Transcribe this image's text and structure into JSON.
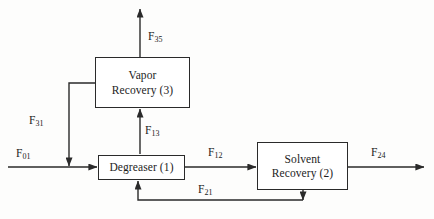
{
  "diagram": {
    "type": "process-flow-diagram",
    "colors": {
      "line": "#2a2a2a",
      "box_border": "#2a2a2a",
      "box_fill": "#ffffff",
      "text": "#1b1b1b",
      "background": "#fdfdfc"
    },
    "units": [
      {
        "id": "degreaser",
        "label": "Degreaser (1)",
        "number": "1",
        "name": "Degreaser",
        "x": 98,
        "y": 155,
        "w": 87,
        "h": 25
      },
      {
        "id": "solvent-recovery",
        "label": "Solvent\nRecovery (2)",
        "number": "2",
        "name": "Solvent Recovery",
        "x": 257,
        "y": 142,
        "w": 91,
        "h": 48
      },
      {
        "id": "vapor-recovery",
        "label": "Vapor\nRecovery (3)",
        "number": "3",
        "name": "Vapor Recovery",
        "x": 95,
        "y": 57,
        "w": 95,
        "h": 51
      }
    ],
    "streams": [
      {
        "id": "f01",
        "symbol": "F",
        "subscript": "01",
        "from": "feed",
        "to": "degreaser",
        "description": "Fresh solvent feed into degreaser"
      },
      {
        "id": "f12",
        "symbol": "F",
        "subscript": "12",
        "from": "degreaser",
        "to": "solvent-recovery",
        "description": "Spent solvent from degreaser to solvent recovery"
      },
      {
        "id": "f21",
        "symbol": "F",
        "subscript": "21",
        "from": "solvent-recovery",
        "to": "degreaser",
        "description": "Recovered solvent recycled back to degreaser"
      },
      {
        "id": "f24",
        "symbol": "F",
        "subscript": "24",
        "from": "solvent-recovery",
        "to": "waste",
        "description": "Solvent recovery outlet stream"
      },
      {
        "id": "f13",
        "symbol": "F",
        "subscript": "13",
        "from": "degreaser",
        "to": "vapor-recovery",
        "description": "Vapor stream from degreaser to vapor recovery"
      },
      {
        "id": "f31",
        "symbol": "F",
        "subscript": "31",
        "from": "vapor-recovery",
        "to": "degreaser",
        "description": "Condensed solvent recycled to degreaser"
      },
      {
        "id": "f35",
        "symbol": "F",
        "subscript": "35",
        "from": "vapor-recovery",
        "to": "vent",
        "description": "Vent stream leaving vapor recovery"
      }
    ]
  }
}
